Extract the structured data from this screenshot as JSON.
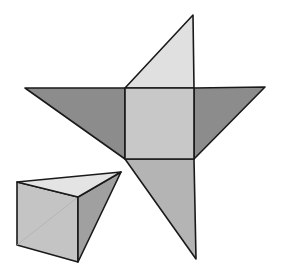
{
  "diagram": {
    "colors": {
      "background": "#ffffff",
      "stroke": "#1a1a1a",
      "square_face": "#c8c8c8",
      "top_triangle": "#e0e0e0",
      "side_triangles": "#8c8c8c",
      "bottom_triangle": "#b4b4b4",
      "prism_top": "#e4e4e4",
      "prism_front": "#c4c4c4",
      "prism_side": "#a0a0a0"
    },
    "net": {
      "square": [
        [
          125,
          88
        ],
        [
          194,
          88
        ],
        [
          194,
          159
        ],
        [
          125,
          159
        ]
      ],
      "top_triangle": [
        [
          125,
          88
        ],
        [
          193,
          15
        ],
        [
          194,
          88
        ]
      ],
      "left_triangle": [
        [
          25,
          88
        ],
        [
          125,
          88
        ],
        [
          125,
          159
        ]
      ],
      "right_triangle": [
        [
          194,
          88
        ],
        [
          265,
          87
        ],
        [
          194,
          159
        ]
      ],
      "bottom_triangle": [
        [
          125,
          159
        ],
        [
          194,
          159
        ],
        [
          196,
          259
        ]
      ]
    },
    "prism": {
      "top_face": [
        [
          17,
          182
        ],
        [
          121,
          172
        ],
        [
          78,
          197
        ]
      ],
      "front_face": [
        [
          17,
          182
        ],
        [
          78,
          197
        ],
        [
          78,
          262
        ],
        [
          17,
          245
        ]
      ],
      "side_face": [
        [
          78,
          197
        ],
        [
          121,
          172
        ],
        [
          78,
          262
        ]
      ],
      "hidden_edge": [
        [
          17,
          245
        ],
        [
          78,
          197
        ]
      ]
    }
  }
}
